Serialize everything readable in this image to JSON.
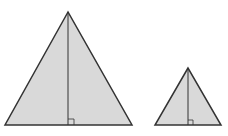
{
  "diagram": {
    "colors": {
      "fill": "#d9d9d9",
      "stroke": "#333333",
      "background": "#ffffff"
    },
    "shapes": [
      {
        "name": "large-triangle",
        "apex": [
          68,
          12
        ],
        "base_left": [
          5,
          125
        ],
        "base_right": [
          132,
          125
        ],
        "altitude_foot": [
          68,
          125
        ]
      },
      {
        "name": "small-triangle",
        "apex": [
          188,
          68
        ],
        "base_left": [
          155,
          125
        ],
        "base_right": [
          221,
          125
        ],
        "altitude_foot": [
          188,
          125
        ]
      }
    ]
  }
}
